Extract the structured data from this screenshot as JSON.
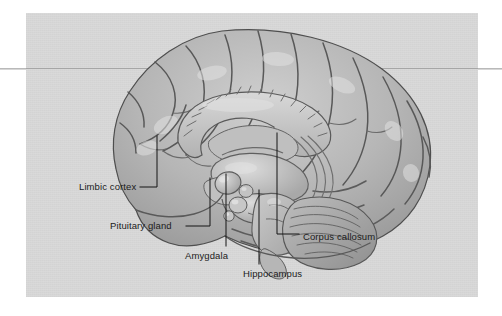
{
  "figure": {
    "kind": "anatomical-illustration",
    "plate_background_color": "#d9d9d9",
    "page_background_color": "#ffffff",
    "rule_color": "#b9b9b9",
    "label_color": "#1b1b1b",
    "leader_color": "#141414"
  },
  "callouts": [
    {
      "id": "limbic-cortex",
      "label": "Limbic cortex",
      "text_x": 79,
      "text_y": 181,
      "leader": "M140,187 L157,187 L157,136"
    },
    {
      "id": "pituitary-gland",
      "label": "Pituitary gland",
      "text_x": 110,
      "text_y": 220,
      "leader": "M186,226 L210,226 L210,178"
    },
    {
      "id": "amygdala",
      "label": "Amygdala",
      "text_x": 185,
      "text_y": 250,
      "leader": "M226,246 L226,174"
    },
    {
      "id": "hippocampus",
      "label": "Hippocampus",
      "text_x": 243,
      "text_y": 268,
      "leader": "M259,264 L259,190"
    },
    {
      "id": "corpus-callosum",
      "label": "Corpus callosum",
      "text_x": 303,
      "text_y": 231,
      "leader": "M299,234 L277,234 L277,133"
    }
  ],
  "brain": {
    "cortex_fill": "#b0b0b0",
    "cortex_fill_light": "#c4c4c4",
    "cortex_outline": "#4a4a4a",
    "sulcus_color": "#5c5c5c",
    "corpus_callosum_fill": "#c9c9c9",
    "ventricle_fill": "#bdbdbd",
    "brainstem_fill": "#bcbcbc",
    "cerebellum_fill": "#a9a9a9",
    "highlight": "#e6e6e6"
  }
}
